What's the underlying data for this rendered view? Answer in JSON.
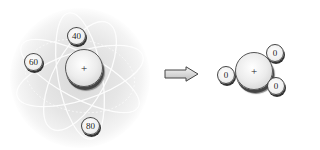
{
  "left_atom": {
    "nucleus_label": "+",
    "electrons": [
      {
        "label": "40"
      },
      {
        "label": "60"
      },
      {
        "label": "80"
      }
    ]
  },
  "right_atom": {
    "nucleus_label": "+",
    "electrons": [
      {
        "label": "0"
      },
      {
        "label": "0"
      },
      {
        "label": "0"
      }
    ]
  },
  "arrow": {
    "direction": "right"
  }
}
